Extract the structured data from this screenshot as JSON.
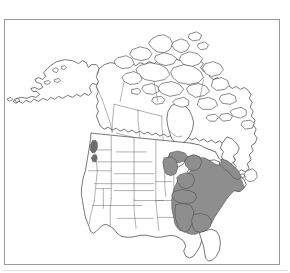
{
  "figure": {
    "width_px": 290,
    "height_px": 273,
    "background_color": "#ffffff"
  },
  "frame": {
    "name": "map-border",
    "border_color": "#9a9a9a",
    "border_width_px": 1,
    "fill_color": "#ffffff",
    "left_px": 4,
    "top_px": 19,
    "width_px": 276,
    "height_px": 246
  },
  "map": {
    "projection_note": "conic, North America centered",
    "coastline_color": "#3c3c3c",
    "subdivision_border_color": "#6f6f6f",
    "ocean_color": "#ffffff",
    "land_color": "#ffffff"
  },
  "range": {
    "label": "shaded distribution range",
    "fill_color": "#8e8e8e",
    "outline_color": "#4a4a4a",
    "outlier_fill_color": "#6d6d6d",
    "extent_description": "eastern United States from the Great Lakes and New England south to the Gulf coastal plain, excluding peninsular Florida",
    "regions_shaded": [
      "Maine",
      "New Hampshire",
      "Vermont",
      "Massachusetts",
      "Rhode Island",
      "Connecticut",
      "New York",
      "New Jersey",
      "Pennsylvania",
      "Delaware",
      "Maryland",
      "Virginia",
      "West Virginia",
      "Ohio",
      "Indiana",
      "Kentucky",
      "Tennessee",
      "North Carolina",
      "South Carolina",
      "Georgia",
      "Alabama",
      "Mississippi",
      "Michigan",
      "Wisconsin"
    ],
    "regions_unshaded_nearby": [
      "Florida",
      "Louisiana",
      "Arkansas",
      "Missouri",
      "Illinois",
      "Iowa",
      "Minnesota",
      "Texas"
    ],
    "outlier_patches": [
      "Pacific Northwest coastal patch"
    ]
  },
  "legend": {
    "present": false,
    "items": []
  },
  "annotations": {
    "present": false,
    "items": []
  },
  "baseline": {
    "name": "footer-rule",
    "color": "#e2e2e2"
  }
}
